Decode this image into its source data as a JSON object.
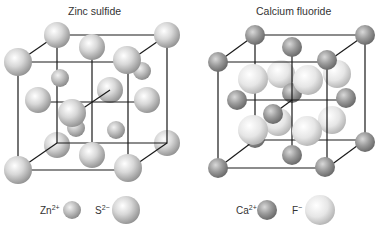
{
  "panels": [
    {
      "title": "Zinc sulfide",
      "legend": [
        {
          "ion": "Zn",
          "charge": "2+",
          "role": "small cation",
          "color": "#bdbdbd"
        },
        {
          "ion": "S",
          "charge": "2−",
          "role": "large anion",
          "color": "#d6d6d6"
        }
      ]
    },
    {
      "title": "Calcium fluoride",
      "legend": [
        {
          "ion": "Ca",
          "charge": "2+",
          "role": "cation",
          "color": "#9a9a9a"
        },
        {
          "ion": "F",
          "charge": "−",
          "role": "anion",
          "color": "#e4e4e4"
        }
      ]
    }
  ],
  "colors": {
    "line": "#1a1a1a",
    "background": "#ffffff",
    "text": "#333333"
  }
}
